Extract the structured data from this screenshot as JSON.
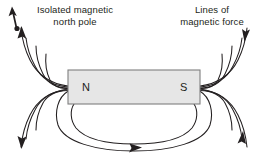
{
  "diagram": {
    "background_color": "#ffffff",
    "line_color": "#231f20",
    "magnet": {
      "fill_color": "#e6e6e6",
      "stroke_color": "#7f7f7f",
      "north_label": "N",
      "south_label": "S",
      "x": 68,
      "y": 70,
      "width": 132,
      "height": 34
    },
    "labels": {
      "left": {
        "text": "Isolated magnetic\nnorth pole",
        "icon": "compass-needle-arrow"
      },
      "right": {
        "text": "Lines of\nmagnetic force"
      }
    },
    "field_lines": {
      "count_per_pole": 5,
      "arrow_direction": "north-to-south",
      "arrowheads": [
        {
          "name": "upper-left-arrow",
          "direction": "up-left"
        },
        {
          "name": "lower-left-arrow",
          "direction": "down-left"
        },
        {
          "name": "upper-right-arrow",
          "direction": "down-right"
        },
        {
          "name": "lower-right-arrow",
          "direction": "up-right"
        },
        {
          "name": "bottom-loop-arrow",
          "direction": "right"
        }
      ]
    }
  }
}
